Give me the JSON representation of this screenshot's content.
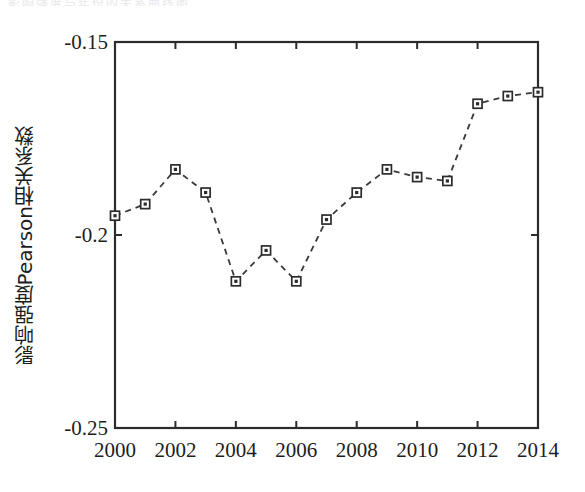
{
  "figure": {
    "caption_remnant": "影响强度与年份的关系曲线图",
    "background": "#ffffff",
    "line_color": "#3a3a3a",
    "marker_face": "#ffffff",
    "marker_edge": "#2b2b2b",
    "axis_color": "#2b2b2b"
  },
  "chart_data": {
    "type": "line",
    "title": "",
    "subtitle": "",
    "xlabel": "",
    "ylabel": "影响强度Pearson相关系数",
    "x": [
      2000,
      2001,
      2002,
      2003,
      2004,
      2005,
      2006,
      2007,
      2008,
      2009,
      2010,
      2011,
      2012,
      2013,
      2014
    ],
    "values": [
      -0.195,
      -0.192,
      -0.183,
      -0.189,
      -0.212,
      -0.204,
      -0.212,
      -0.196,
      -0.189,
      -0.183,
      -0.185,
      -0.186,
      -0.166,
      -0.164,
      -0.163
    ],
    "series": [
      {
        "name": "影响强度Pearson相关系数",
        "values": [
          -0.195,
          -0.192,
          -0.183,
          -0.189,
          -0.212,
          -0.204,
          -0.212,
          -0.196,
          -0.189,
          -0.183,
          -0.185,
          -0.186,
          -0.166,
          -0.164,
          -0.163
        ]
      }
    ],
    "xlim": [
      2000,
      2014
    ],
    "ylim": [
      -0.25,
      -0.15
    ],
    "xticks": [
      2000,
      2002,
      2004,
      2006,
      2008,
      2010,
      2012,
      2014
    ],
    "xtick_labels": [
      "2000",
      "2002",
      "2004",
      "2006",
      "2008",
      "2010",
      "2012",
      "2014"
    ],
    "yticks": [
      -0.15,
      -0.2,
      -0.25
    ],
    "ytick_labels": [
      "-0.15",
      "-0.2",
      "-0.25"
    ],
    "grid": false,
    "legend": null,
    "linestyle": "dashed",
    "marker": "square"
  }
}
